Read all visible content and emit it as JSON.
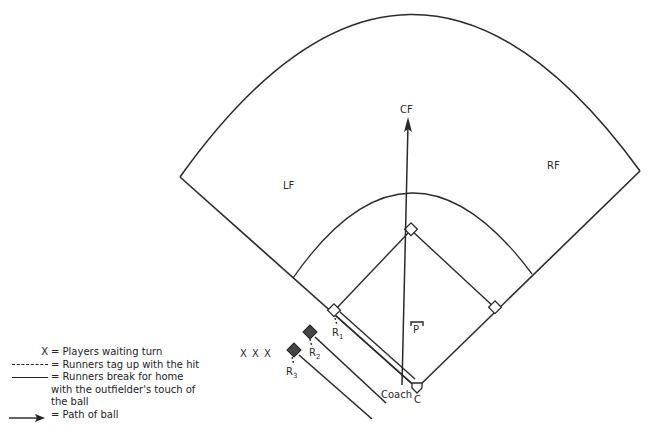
{
  "diagram": {
    "type": "baseball field play diagram",
    "positions": {
      "cf": "CF",
      "lf": "LF",
      "rf": "RF",
      "pitcher": "P",
      "catcher": "C",
      "coach": "Coach"
    },
    "runners": {
      "r1": {
        "label": "R",
        "sub": "1"
      },
      "r2": {
        "label": "R",
        "sub": "2"
      },
      "r3": {
        "label": "R",
        "sub": "3"
      }
    },
    "waiting_players": "X X X",
    "colors": {
      "line": "#222222",
      "runner_fill": "#444444",
      "background": "#ffffff"
    }
  },
  "legend": {
    "items": [
      {
        "key": "X",
        "key_type": "symbol",
        "text": "= Players waiting turn"
      },
      {
        "key": "----",
        "key_type": "dashed-line",
        "text": "= Runners tag up with the hit"
      },
      {
        "key": "——",
        "key_type": "solid-line",
        "text": "= Runners break for home with the outfielder's touch of the ball"
      },
      {
        "key": "→",
        "key_type": "arrow",
        "text": "= Path of ball"
      }
    ]
  }
}
